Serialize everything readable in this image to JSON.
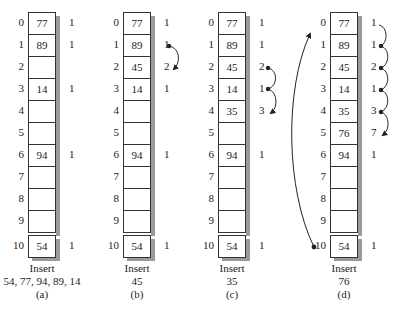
{
  "panels": [
    {
      "id": "a",
      "x": 28,
      "cells": [
        "77",
        "89",
        "",
        "14",
        "",
        "",
        "94",
        "",
        "",
        "",
        "54"
      ],
      "counts": [
        "1",
        "1",
        "",
        "1",
        "",
        "",
        "1",
        "",
        "",
        "",
        "1"
      ],
      "caption_line1": "Insert",
      "caption_line2": "54, 77, 94, 89, 14",
      "caption_label": "(a)"
    },
    {
      "id": "b",
      "x": 123,
      "cells": [
        "77",
        "89",
        "45",
        "14",
        "",
        "",
        "94",
        "",
        "",
        "",
        "54"
      ],
      "counts": [
        "1",
        "1",
        "2",
        "1",
        "",
        "",
        "1",
        "",
        "",
        "",
        "1"
      ],
      "caption_line1": "Insert",
      "caption_line2": "45",
      "caption_label": "(b)"
    },
    {
      "id": "c",
      "x": 218,
      "cells": [
        "77",
        "89",
        "45",
        "14",
        "35",
        "",
        "94",
        "",
        "",
        "",
        "54"
      ],
      "counts": [
        "1",
        "1",
        "2",
        "1",
        "3",
        "",
        "1",
        "",
        "",
        "",
        "1"
      ],
      "caption_line1": "Insert",
      "caption_line2": "35",
      "caption_label": "(c)"
    },
    {
      "id": "d",
      "x": 330,
      "cells": [
        "77",
        "89",
        "45",
        "14",
        "35",
        "76",
        "94",
        "",
        "",
        "",
        "54"
      ],
      "counts": [
        "1",
        "1",
        "2",
        "1",
        "3",
        "7",
        "1",
        "",
        "",
        "",
        "1"
      ],
      "caption_line1": "Insert",
      "caption_line2": "76",
      "caption_label": "(d)"
    }
  ],
  "indices": [
    "0",
    "1",
    "2",
    "3",
    "4",
    "5",
    "6",
    "7",
    "8",
    "9",
    "10"
  ],
  "colors": {
    "line": "#222222",
    "shadow": "#9a9a9a",
    "cell_bg": "#ffffff"
  }
}
